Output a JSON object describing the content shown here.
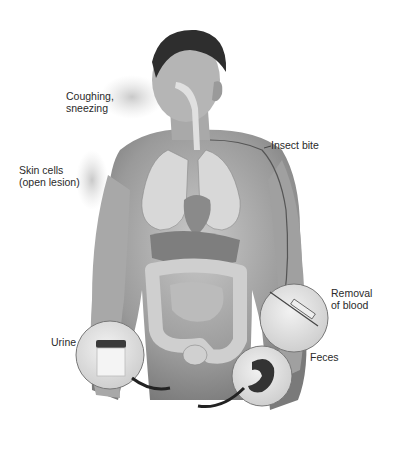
{
  "figure": {
    "labels": {
      "coughing": [
        "Coughing,",
        "sneezing"
      ],
      "skin": [
        "Skin cells",
        "(open lesion)"
      ],
      "insect": "Insect bite",
      "blood": [
        "Removal",
        "of blood"
      ],
      "urine": "Urine",
      "feces": "Feces"
    }
  }
}
